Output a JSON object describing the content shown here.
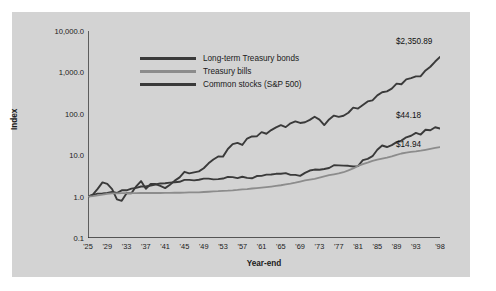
{
  "chart_data": {
    "type": "line",
    "title": "",
    "xlabel": "Year-end",
    "ylabel": "Index",
    "yscale": "log",
    "ylim": [
      0.1,
      10000
    ],
    "ytick_labels": [
      "10,000.0",
      "1,000.0",
      "100.0",
      "10.0",
      "1.0",
      "0.1"
    ],
    "ytick_values": [
      10000,
      1000,
      100,
      10,
      1,
      0.1
    ],
    "xlim": [
      1925,
      1998
    ],
    "xtick_labels": [
      "'25",
      "'29",
      "'33",
      "'37",
      "'41",
      "'45",
      "'49",
      "'53",
      "'57",
      "'61",
      "'65",
      "'69",
      "'73",
      "'77",
      "'81",
      "'85",
      "'89",
      "'93",
      "'98"
    ],
    "xtick_values": [
      1925,
      1929,
      1933,
      1937,
      1941,
      1945,
      1949,
      1953,
      1957,
      1961,
      1965,
      1969,
      1973,
      1977,
      1981,
      1985,
      1989,
      1993,
      1998
    ],
    "grid": false,
    "legend_position": "top-center",
    "colors": {
      "long_term_treasury_bonds": "#3a3a3a",
      "treasury_bills": "#8c8c8c",
      "common_stocks": "#3a3a3a",
      "panel_background": "#d3d3d3",
      "page_background": "#ffffff",
      "axis": "#2b2b2b"
    },
    "end_labels": [
      {
        "text": "$2,350.89",
        "series": "Common stocks (S&P 500)",
        "value": 2350.89,
        "year": 1998
      },
      {
        "text": "$44.18",
        "series": "Long-term Treasury bonds",
        "value": 44.18,
        "year": 1998
      },
      {
        "text": "$14.94",
        "series": "Treasury bills",
        "value": 14.94,
        "year": 1998
      }
    ],
    "x": [
      1925,
      1926,
      1927,
      1928,
      1929,
      1930,
      1931,
      1932,
      1933,
      1934,
      1935,
      1936,
      1937,
      1938,
      1939,
      1940,
      1941,
      1942,
      1943,
      1944,
      1945,
      1946,
      1947,
      1948,
      1949,
      1950,
      1951,
      1952,
      1953,
      1954,
      1955,
      1956,
      1957,
      1958,
      1959,
      1960,
      1961,
      1962,
      1963,
      1964,
      1965,
      1966,
      1967,
      1968,
      1969,
      1970,
      1971,
      1972,
      1973,
      1974,
      1975,
      1976,
      1977,
      1978,
      1979,
      1980,
      1981,
      1982,
      1983,
      1984,
      1985,
      1986,
      1987,
      1988,
      1989,
      1990,
      1991,
      1992,
      1993,
      1994,
      1995,
      1996,
      1997,
      1998
    ],
    "series": [
      {
        "name": "Common stocks (S&P 500)",
        "values": [
          1.0,
          1.12,
          1.54,
          2.2,
          2.02,
          1.52,
          0.86,
          0.79,
          1.21,
          1.2,
          1.77,
          2.37,
          1.54,
          2.02,
          2.01,
          1.81,
          1.6,
          1.93,
          2.43,
          2.91,
          3.97,
          3.65,
          3.85,
          4.06,
          4.83,
          6.36,
          7.89,
          9.34,
          9.24,
          14.11,
          18.56,
          19.78,
          17.65,
          25.3,
          28.32,
          28.46,
          36.11,
          32.95,
          40.47,
          47.14,
          53.01,
          47.67,
          59.1,
          65.64,
          60.06,
          62.47,
          71.41,
          84.96,
          72.5,
          53.31,
          73.14,
          90.58,
          84.08,
          89.59,
          106.11,
          140.52,
          133.62,
          162.42,
          199.07,
          211.6,
          278.7,
          330.58,
          348.0,
          405.7,
          534.13,
          517.5,
          675.59,
          727.41,
          800.08,
          810.54,
          1113.92,
          1370.46,
          1828.33,
          2350.89
        ]
      },
      {
        "name": "Long-term Treasury bonds",
        "values": [
          1.0,
          1.08,
          1.18,
          1.19,
          1.23,
          1.29,
          1.22,
          1.42,
          1.42,
          1.56,
          1.63,
          1.75,
          1.75,
          1.85,
          1.96,
          2.08,
          2.1,
          2.17,
          2.22,
          2.28,
          2.53,
          2.53,
          2.46,
          2.55,
          2.72,
          2.72,
          2.61,
          2.64,
          2.73,
          3.0,
          2.96,
          2.8,
          3.01,
          2.83,
          2.77,
          3.14,
          3.17,
          3.39,
          3.43,
          3.55,
          3.56,
          3.69,
          3.35,
          3.34,
          3.17,
          3.75,
          4.26,
          4.5,
          4.45,
          4.64,
          4.9,
          5.71,
          5.67,
          5.6,
          5.54,
          5.33,
          5.44,
          7.57,
          8.16,
          9.46,
          13.55,
          17.15,
          15.75,
          17.52,
          20.71,
          22.46,
          27.01,
          29.47,
          34.63,
          31.55,
          41.26,
          40.01,
          47.32,
          44.18
        ]
      },
      {
        "name": "Treasury bills",
        "values": [
          1.0,
          1.03,
          1.07,
          1.11,
          1.16,
          1.19,
          1.2,
          1.21,
          1.21,
          1.21,
          1.21,
          1.22,
          1.22,
          1.22,
          1.22,
          1.22,
          1.23,
          1.23,
          1.24,
          1.24,
          1.25,
          1.26,
          1.26,
          1.27,
          1.29,
          1.31,
          1.33,
          1.35,
          1.38,
          1.39,
          1.41,
          1.45,
          1.5,
          1.52,
          1.57,
          1.61,
          1.65,
          1.7,
          1.75,
          1.81,
          1.88,
          1.97,
          2.06,
          2.17,
          2.31,
          2.46,
          2.57,
          2.67,
          2.86,
          3.08,
          3.28,
          3.45,
          3.62,
          3.88,
          4.29,
          4.79,
          5.5,
          6.09,
          6.62,
          7.27,
          7.83,
          8.31,
          8.77,
          9.39,
          10.21,
          10.99,
          11.6,
          11.99,
          12.34,
          12.82,
          13.53,
          14.23,
          14.97,
          15.7
        ]
      }
    ]
  },
  "legend": {
    "items": [
      {
        "label": "Long-term Treasury bonds",
        "color": "#3a3a3a"
      },
      {
        "label": "Treasury bills",
        "color": "#8c8c8c"
      },
      {
        "label": "Common stocks (S&P 500)",
        "color": "#3a3a3a"
      }
    ]
  },
  "axis_titles": {
    "y": "Index",
    "x": "Year-end"
  }
}
